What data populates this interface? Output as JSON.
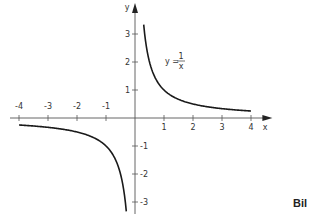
{
  "chart_data": {
    "type": "line",
    "title": "",
    "function": "y = 1/x",
    "annotation": {
      "text_lhs": "y =",
      "numerator": "1",
      "denominator": "x"
    },
    "xlabel": "x",
    "ylabel": "y",
    "xlim": [
      -4.3,
      4.6
    ],
    "ylim": [
      -3.3,
      4.2
    ],
    "x_ticks": [
      -4,
      -3,
      -2,
      -1,
      1,
      2,
      3,
      4
    ],
    "x_tick_labels": [
      "-4",
      "-3",
      "-2",
      "-1",
      "1",
      "2",
      "3",
      "4"
    ],
    "y_ticks": [
      -3,
      -2,
      -1,
      1,
      2,
      3
    ],
    "y_tick_labels": [
      "-3",
      "-2",
      "-1",
      "1",
      "2",
      "3"
    ],
    "grid": false,
    "series": [
      {
        "name": "positive branch",
        "x": [
          0.3,
          0.5,
          1,
          2,
          3,
          4
        ],
        "y": [
          3.33,
          2,
          1,
          0.5,
          0.33,
          0.25
        ]
      },
      {
        "name": "negative branch",
        "x": [
          -4,
          -3,
          -2,
          -1,
          -0.5,
          -0.3
        ],
        "y": [
          -0.25,
          -0.33,
          -0.5,
          -1,
          -2,
          -3.33
        ]
      }
    ]
  },
  "caption_fragment": "Bil"
}
